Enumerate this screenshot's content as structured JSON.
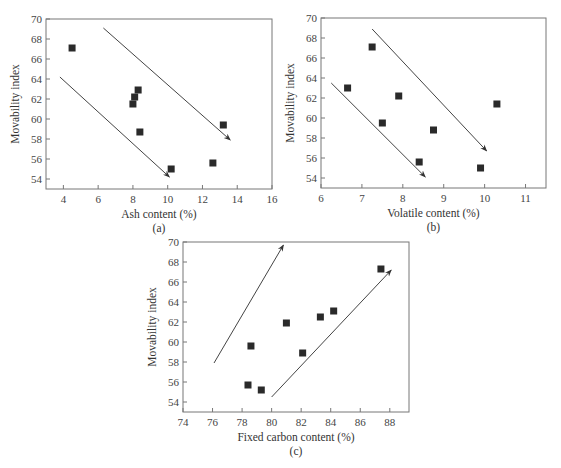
{
  "chart_data": [
    {
      "id": "a",
      "type": "scatter",
      "subtitle": "(a)",
      "xlabel": "Ash content (%)",
      "ylabel": "Movability index",
      "xlim": [
        3,
        16
      ],
      "ylim": [
        53,
        70
      ],
      "xticks": [
        4,
        6,
        8,
        10,
        12,
        14,
        16
      ],
      "yticks": [
        54,
        56,
        58,
        60,
        62,
        64,
        66,
        68,
        70
      ],
      "grid": false,
      "marker": "square",
      "points": [
        {
          "x": 4.5,
          "y": 67.1
        },
        {
          "x": 8.0,
          "y": 61.5
        },
        {
          "x": 8.1,
          "y": 62.2
        },
        {
          "x": 8.3,
          "y": 62.9
        },
        {
          "x": 8.4,
          "y": 58.7
        },
        {
          "x": 10.2,
          "y": 55.0
        },
        {
          "x": 12.6,
          "y": 55.6
        },
        {
          "x": 13.2,
          "y": 59.4
        }
      ],
      "annotations": [
        {
          "type": "arrow",
          "from": [
            3.8,
            64.2
          ],
          "to": [
            10.1,
            54.2
          ]
        },
        {
          "type": "arrow",
          "from": [
            6.3,
            69.1
          ],
          "to": [
            13.6,
            57.9
          ]
        }
      ],
      "box": {
        "left": 46,
        "top": 19,
        "right": 272,
        "bottom": 189
      }
    },
    {
      "id": "b",
      "type": "scatter",
      "subtitle": "(b)",
      "xlabel": "Volatile content (%)",
      "ylabel": "Movability index",
      "xlim": [
        6,
        11.5
      ],
      "ylim": [
        53,
        70
      ],
      "xticks": [
        6,
        7,
        8,
        9,
        10,
        11
      ],
      "yticks": [
        54,
        56,
        58,
        60,
        62,
        64,
        66,
        68,
        70
      ],
      "grid": false,
      "marker": "square",
      "points": [
        {
          "x": 6.65,
          "y": 63.0
        },
        {
          "x": 7.25,
          "y": 67.1
        },
        {
          "x": 7.5,
          "y": 59.5
        },
        {
          "x": 7.9,
          "y": 62.2
        },
        {
          "x": 8.4,
          "y": 55.6
        },
        {
          "x": 8.75,
          "y": 58.8
        },
        {
          "x": 9.9,
          "y": 55.0
        },
        {
          "x": 10.3,
          "y": 61.4
        }
      ],
      "annotations": [
        {
          "type": "arrow",
          "from": [
            6.25,
            63.5
          ],
          "to": [
            8.55,
            54.1
          ]
        },
        {
          "type": "arrow",
          "from": [
            7.25,
            68.9
          ],
          "to": [
            10.05,
            56.7
          ]
        }
      ],
      "box": {
        "left": 321,
        "top": 18,
        "right": 546,
        "bottom": 188
      }
    },
    {
      "id": "c",
      "type": "scatter",
      "subtitle": "(c)",
      "xlabel": "Fixed carbon content (%)",
      "ylabel": "Movability index",
      "xlim": [
        74,
        89.3
      ],
      "ylim": [
        53,
        70
      ],
      "xticks": [
        74,
        76,
        78,
        80,
        82,
        84,
        86,
        88
      ],
      "yticks": [
        54,
        56,
        58,
        60,
        62,
        64,
        66,
        68,
        70
      ],
      "grid": false,
      "marker": "square",
      "points": [
        {
          "x": 78.4,
          "y": 55.7
        },
        {
          "x": 78.6,
          "y": 59.6
        },
        {
          "x": 79.3,
          "y": 55.2
        },
        {
          "x": 81.0,
          "y": 61.9
        },
        {
          "x": 82.1,
          "y": 58.9
        },
        {
          "x": 83.3,
          "y": 62.5
        },
        {
          "x": 84.2,
          "y": 63.1
        },
        {
          "x": 87.4,
          "y": 67.3
        }
      ],
      "annotations": [
        {
          "type": "arrow",
          "from": [
            76.1,
            57.9
          ],
          "to": [
            80.8,
            69.7
          ]
        },
        {
          "type": "arrow",
          "from": [
            80.0,
            54.5
          ],
          "to": [
            88.1,
            67.2
          ]
        }
      ],
      "box": {
        "left": 183,
        "top": 242,
        "right": 409,
        "bottom": 412
      }
    }
  ],
  "labels": {
    "a": {
      "subtitle": "(a)",
      "xlabel": "Ash content (%)",
      "ylabel": "Movability index"
    },
    "b": {
      "subtitle": "(b)",
      "xlabel": "Volatile content (%)",
      "ylabel": "Movability index"
    },
    "c": {
      "subtitle": "(c)",
      "xlabel": "Fixed carbon content (%)",
      "ylabel": "Movability index"
    }
  }
}
